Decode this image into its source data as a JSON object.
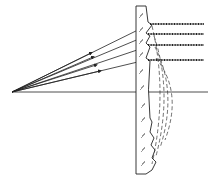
{
  "diagram": {
    "type": "fresnel-lens-ray-diagram",
    "colors": {
      "line": "#222222",
      "background": "#ffffff"
    },
    "focal_point": {
      "x": 12,
      "y": 92
    },
    "optical_axis_y": 92,
    "incoming_rays": [
      {
        "lens_y": 26,
        "arrow_at": 0.6
      },
      {
        "lens_y": 36,
        "arrow_at": 0.6
      },
      {
        "lens_y": 47,
        "arrow_at": 0.65
      },
      {
        "lens_y": 60,
        "arrow_at": 0.65
      }
    ],
    "outgoing_rays_y": [
      24,
      34,
      45,
      60
    ],
    "labels": []
  }
}
